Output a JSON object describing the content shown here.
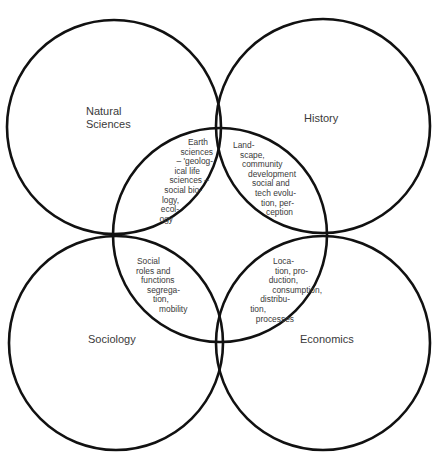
{
  "diagram": {
    "type": "overlapping-circles",
    "stroke_color": "#111111",
    "stroke_width": 2.6,
    "circles": [
      {
        "id": "center",
        "cx": 220,
        "cy": 235,
        "r": 107
      },
      {
        "id": "natural-sciences",
        "cx": 114,
        "cy": 127,
        "r": 107
      },
      {
        "id": "history",
        "cx": 323,
        "cy": 126,
        "r": 107
      },
      {
        "id": "sociology",
        "cx": 116,
        "cy": 343,
        "r": 107
      },
      {
        "id": "economics",
        "cx": 323,
        "cy": 343,
        "r": 107
      }
    ],
    "disciplines": {
      "natural_sciences": [
        "Natural",
        "Sciences"
      ],
      "history": "History",
      "sociology": "Sociology",
      "economics": "Economics"
    },
    "overlaps": {
      "natural_sciences": [
        "Earth",
        "sciences",
        "– 'geolog-",
        "ical life",
        "sciences –",
        "social bio-",
        "logy,",
        "ecol-",
        "ogy"
      ],
      "history": [
        "Land-",
        "scape,",
        "community",
        "development",
        "social and",
        "tech evolu-",
        "tion, per-",
        "ception"
      ],
      "sociology": [
        "Social",
        "roles and",
        "functions",
        "segrega-",
        "tion,",
        "mobility"
      ],
      "economics": [
        "Loca-",
        "tion, pro-",
        "duction,",
        "consumption,",
        "distribu-",
        "tion,",
        "processes"
      ]
    }
  }
}
